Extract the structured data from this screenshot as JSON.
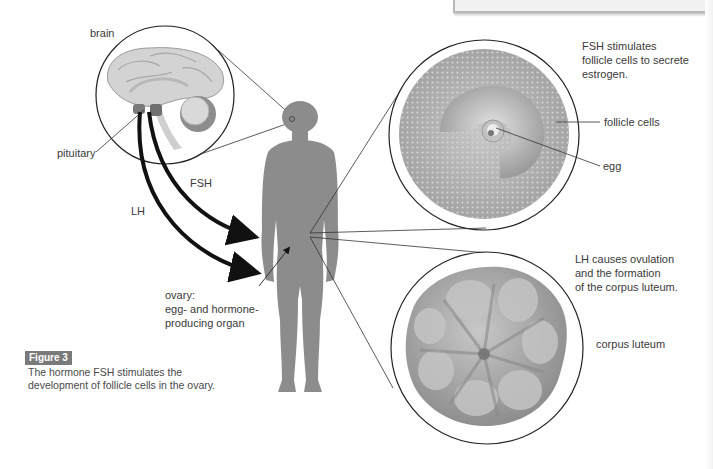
{
  "figure": {
    "badge": "Figure 3",
    "caption_line1": "The hormone FSH stimulates the",
    "caption_line2": "development of follicle cells in the ovary."
  },
  "labels": {
    "brain": "brain",
    "pituitary": "pituitary",
    "fsh": "FSH",
    "lh": "LH",
    "ovary_line1": "ovary:",
    "ovary_line2": "egg- and hormone-",
    "ovary_line3": "producing organ",
    "fsh_note_line1": "FSH stimulates",
    "fsh_note_line2": "follicle cells to secrete",
    "fsh_note_line3": "estrogen.",
    "follicle_cells": "follicle cells",
    "egg": "egg",
    "lh_note_line1": "LH causes ovulation",
    "lh_note_line2": "and the formation",
    "lh_note_line3": "of the corpus luteum.",
    "corpus_luteum": "corpus luteum"
  },
  "colors": {
    "body": "#8c8c8c",
    "brain": "#cfcfcf",
    "follicle": "#a9a9a9",
    "corpus_luteum": "#9a9a9a",
    "arrow": "#111111",
    "badge": "#7a7a7a"
  }
}
